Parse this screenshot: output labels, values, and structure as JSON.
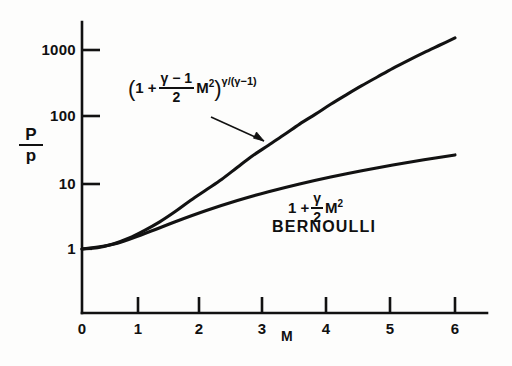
{
  "chart_data": {
    "type": "line",
    "title": "",
    "xlabel": "M",
    "ylabel": "P/p",
    "xlim": [
      0,
      6.4
    ],
    "ylim": [
      1,
      3000
    ],
    "yscale": "log",
    "xscale": "linear",
    "grid": false,
    "legend_position": "inline-annotations",
    "xticks": [
      "0",
      "1",
      "2",
      "3",
      "4",
      "5",
      "6"
    ],
    "xtick_values": [
      0,
      1,
      2,
      3,
      4,
      5,
      6
    ],
    "yticks": [
      "1",
      "10",
      "100",
      "1000"
    ],
    "ytick_values": [
      1,
      10,
      100,
      1000
    ],
    "series": [
      {
        "name": "isentropic",
        "annotation": "(1 + ((γ-1)/2) M^2)^(γ/(γ-1))",
        "x": [
          0,
          0.25,
          0.5,
          0.75,
          1,
          1.25,
          1.5,
          1.75,
          2,
          2.25,
          2.5,
          2.75,
          3,
          3.25,
          3.5,
          3.75,
          4,
          4.25,
          4.5,
          4.75,
          5,
          5.25,
          5.5,
          5.75,
          6
        ],
        "values": [
          1.0,
          1.045,
          1.186,
          1.452,
          1.893,
          2.566,
          3.671,
          5.439,
          7.824,
          11.26,
          17.09,
          25.7,
          36.7,
          52.6,
          76.3,
          107.0,
          152.0,
          211.0,
          290.0,
          392.0,
          529.0,
          700.0,
          915.0,
          1180.0,
          1520.0
        ]
      },
      {
        "name": "bernoulli",
        "annotation": "1 + (γ/2) M^2",
        "x": [
          0,
          0.5,
          1,
          1.5,
          2,
          2.5,
          3,
          3.5,
          4,
          4.5,
          5,
          5.5,
          6
        ],
        "values": [
          1.0,
          1.175,
          1.7,
          2.575,
          3.8,
          5.375,
          7.3,
          9.575,
          12.2,
          15.175,
          18.5,
          22.175,
          26.2
        ]
      }
    ],
    "annotations": [
      {
        "name": "isentropic-formula",
        "text": "(1 + (γ-1)/2 M²)^(γ/(γ-1))",
        "has_arrow": true,
        "arrow_target_x": 3.0,
        "arrow_target_y": 37
      },
      {
        "name": "bernoulli-formula",
        "text": "1 + γ/2 M²",
        "has_arrow": false
      },
      {
        "name": "bernoulli-label",
        "text": "BERNOULLI",
        "has_arrow": false
      }
    ]
  },
  "axes": {
    "y_title_numerator": "P",
    "y_title_denominator": "p",
    "x_title": "M",
    "ytick_labels": [
      "1000",
      "100",
      "10",
      "1"
    ],
    "xtick_labels": [
      "0",
      "1",
      "2",
      "3",
      "4",
      "5",
      "6"
    ]
  },
  "formulas": {
    "isentropic": {
      "open_paren": "(",
      "one_plus": "1 +",
      "frac_top": "γ − 1",
      "frac_bottom": "2",
      "mach": "M",
      "mach_power": "2",
      "close_paren": ")",
      "exponent": "γ/(γ−1)"
    },
    "bernoulli": {
      "one_plus": "1 +",
      "frac_top": "γ",
      "frac_bottom": "2",
      "mach": "M",
      "mach_power": "2",
      "name": "BERNOULLI"
    }
  },
  "colors": {
    "ink": "#111111",
    "background": "#fdfdfc"
  }
}
